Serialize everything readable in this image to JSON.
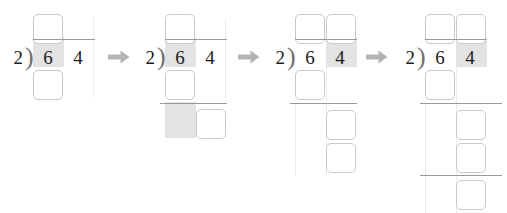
{
  "worksheet": {
    "title": "long-division-step-sequence",
    "problem": {
      "divisor": "2",
      "dividend": "64",
      "bracket_glyph": ")"
    },
    "colors": {
      "digit": "#1c1c1c",
      "highlight": "#e3e3e3",
      "box_border": "#c9c9c9",
      "rule": "#9a9a9a",
      "guide": "#ebebeb",
      "arrow": "#b4b4b4"
    },
    "arrows": [
      {
        "name": "arrow-step-1-to-2",
        "glyph": "right-arrow"
      },
      {
        "name": "arrow-step-2-to-3",
        "glyph": "right-arrow"
      },
      {
        "name": "arrow-step-3-to-4",
        "glyph": "right-arrow"
      }
    ],
    "steps": [
      {
        "index": "1",
        "label": "step-1",
        "divisor": "2",
        "bracket": ")",
        "digits": [
          {
            "name": "dividend-digit-tens",
            "value": "6",
            "highlighted": "true"
          },
          {
            "name": "dividend-digit-ones",
            "value": "4",
            "highlighted": "false"
          }
        ],
        "quotient_boxes": [
          {
            "name": "quotient-box-tens",
            "value": ""
          }
        ],
        "work_boxes": [
          {
            "name": "work-box-multiply-tens",
            "value": ""
          }
        ],
        "rules": "1"
      },
      {
        "index": "2",
        "label": "step-2",
        "divisor": "2",
        "bracket": ")",
        "digits": [
          {
            "name": "dividend-digit-tens",
            "value": "6",
            "highlighted": "true"
          },
          {
            "name": "dividend-digit-ones",
            "value": "4",
            "highlighted": "false"
          }
        ],
        "quotient_boxes": [
          {
            "name": "quotient-box-tens",
            "value": ""
          }
        ],
        "work_boxes": [
          {
            "name": "work-box-multiply-tens",
            "value": ""
          },
          {
            "name": "work-box-bring-down",
            "value": ""
          }
        ],
        "rules": "2"
      },
      {
        "index": "3",
        "label": "step-3",
        "divisor": "2",
        "bracket": ")",
        "digits": [
          {
            "name": "dividend-digit-tens",
            "value": "6",
            "highlighted": "false"
          },
          {
            "name": "dividend-digit-ones",
            "value": "4",
            "highlighted": "true"
          }
        ],
        "quotient_boxes": [
          {
            "name": "quotient-box-tens",
            "value": ""
          },
          {
            "name": "quotient-box-ones",
            "value": ""
          }
        ],
        "work_boxes": [
          {
            "name": "work-box-multiply-tens",
            "value": ""
          },
          {
            "name": "work-box-bring-down",
            "value": ""
          },
          {
            "name": "work-box-multiply-ones",
            "value": ""
          }
        ],
        "rules": "2"
      },
      {
        "index": "4",
        "label": "step-4",
        "divisor": "2",
        "bracket": ")",
        "digits": [
          {
            "name": "dividend-digit-tens",
            "value": "6",
            "highlighted": "false"
          },
          {
            "name": "dividend-digit-ones",
            "value": "4",
            "highlighted": "true"
          }
        ],
        "quotient_boxes": [
          {
            "name": "quotient-box-tens",
            "value": ""
          },
          {
            "name": "quotient-box-ones",
            "value": ""
          }
        ],
        "work_boxes": [
          {
            "name": "work-box-multiply-tens",
            "value": ""
          },
          {
            "name": "work-box-bring-down",
            "value": ""
          },
          {
            "name": "work-box-multiply-ones",
            "value": ""
          },
          {
            "name": "work-box-remainder",
            "value": ""
          }
        ],
        "rules": "3"
      }
    ]
  }
}
